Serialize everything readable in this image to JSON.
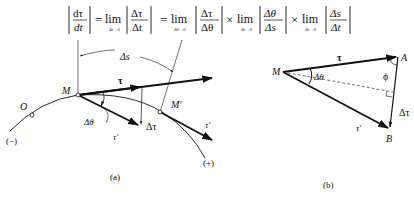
{
  "formula": {
    "lhs_num": "dτ",
    "lhs_den": "dt",
    "eq1": "=",
    "lim1": "lim",
    "lim1_sub": "Δt→0",
    "f1_num": "Δτ",
    "f1_den": "Δt",
    "eq2": "=",
    "lim2": "lim",
    "lim2_sub": "Δθ→0",
    "f2_num": "Δτ",
    "f2_den": "Δθ",
    "times1": "×",
    "lim3": "lim",
    "lim3_sub": "Δt→0",
    "f3_num": "Δθ",
    "f3_den": "Δs",
    "times2": "×",
    "lim4": "lim",
    "lim4_sub": "Δt→0",
    "f4_num": "Δs",
    "f4_den": "Δt"
  },
  "figure_a": {
    "caption": "(a)",
    "labels": {
      "origin": "O",
      "point_m": "M",
      "point_m_prime": "M′",
      "arc_length": "Δs",
      "tangent": "τ",
      "tangent_prime_at_m": "τ′",
      "tangent_prime_at_m_prime": "τ′",
      "delta_tau": "Δτ",
      "delta_theta": "Δθ",
      "negative_direction": "(−)",
      "positive_direction": "(+)"
    }
  },
  "figure_b": {
    "caption": "(b)",
    "labels": {
      "point_m": "M",
      "point_a": "A",
      "point_b": "B",
      "tangent": "τ",
      "tangent_prime": "τ′",
      "delta_tau": "Δτ",
      "delta_theta": "Δθ",
      "angle_phi": "ϕ"
    }
  }
}
